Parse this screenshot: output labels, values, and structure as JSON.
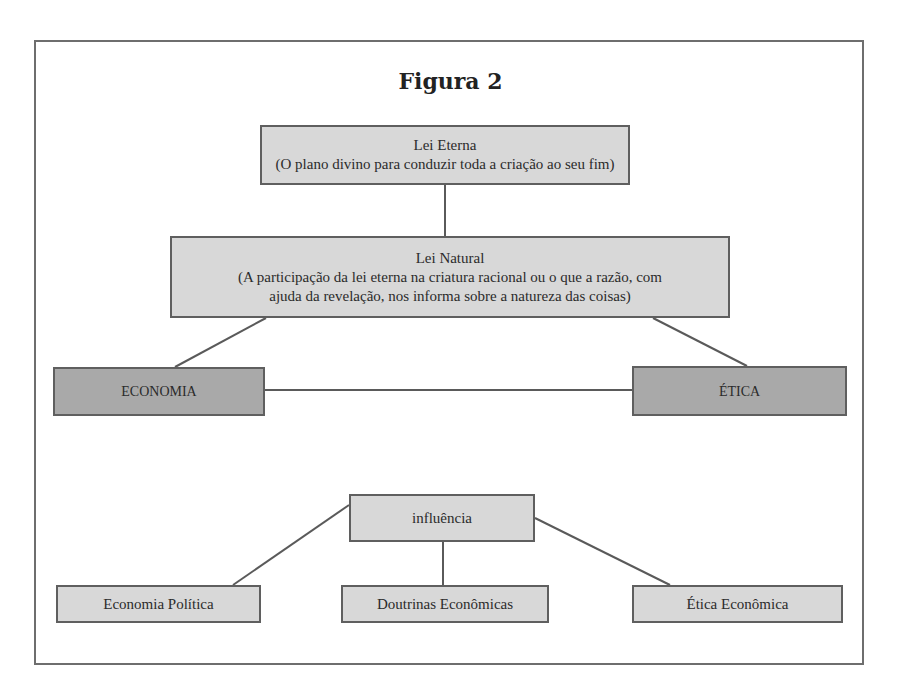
{
  "figure": {
    "title": "Figura 2",
    "colors": {
      "light_box": "#d8d8d8",
      "dark_box": "#a9a9a9",
      "border": "#5f5f5f"
    },
    "nodes": {
      "lei_eterna": {
        "title": "Lei Eterna",
        "description": "(O plano divino para conduzir toda a criação ao seu fim)"
      },
      "lei_natural": {
        "title": "Lei Natural",
        "description_line1": "(A participação da lei eterna na criatura racional ou o que a razão, com",
        "description_line2": "ajuda da revelação, nos informa sobre a natureza das coisas)"
      },
      "economia": {
        "label": "ECONOMIA"
      },
      "etica": {
        "label": "ÉTICA"
      },
      "influencia": {
        "label": "influência"
      },
      "economia_politica": {
        "label": "Economia Política"
      },
      "doutrinas_economicas": {
        "label": "Doutrinas Econômicas"
      },
      "etica_economica": {
        "label": "Ética Econômica"
      }
    },
    "edges": [
      [
        "lei_eterna",
        "lei_natural"
      ],
      [
        "lei_natural",
        "economia"
      ],
      [
        "lei_natural",
        "etica"
      ],
      [
        "economia",
        "etica"
      ],
      [
        "influencia",
        "economia_politica"
      ],
      [
        "influencia",
        "doutrinas_economicas"
      ],
      [
        "influencia",
        "etica_economica"
      ]
    ]
  }
}
